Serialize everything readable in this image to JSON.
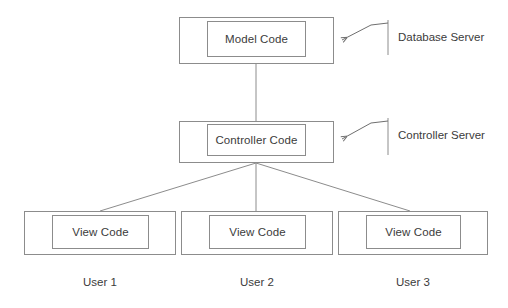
{
  "diagram": {
    "colors": {
      "background": "#ffffff",
      "stroke": "#8c8c8c",
      "text": "#3b3b3b"
    },
    "nodes": {
      "model": {
        "label": "Model Code"
      },
      "controller": {
        "label": "Controller Code"
      },
      "views": [
        {
          "label": "View Code",
          "user": "User 1"
        },
        {
          "label": "View Code",
          "user": "User 2"
        },
        {
          "label": "View Code",
          "user": "User 3"
        }
      ]
    },
    "annotations": [
      {
        "label": "Database Server"
      },
      {
        "label": "Controller Server"
      }
    ]
  }
}
